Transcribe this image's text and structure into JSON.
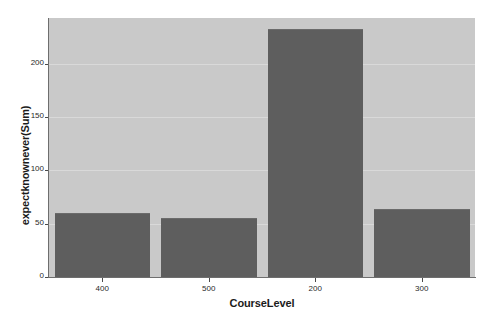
{
  "chart_data": {
    "type": "bar",
    "title": "",
    "subtitle": "",
    "xlabel": "CourseLevel",
    "ylabel": "expectknownever(Sum)",
    "categories": [
      "400",
      "500",
      "200",
      "300"
    ],
    "values": [
      60,
      55,
      233,
      64
    ],
    "series": [
      {
        "name": "expectknownever(Sum)",
        "values": [
          60,
          55,
          233,
          64
        ]
      }
    ],
    "ylim": [
      0,
      243
    ],
    "yticks": [
      "0",
      "50",
      "100",
      "150",
      "200"
    ],
    "ytick_values": [
      0,
      50,
      100,
      150,
      200
    ],
    "xticks": [
      "400",
      "500",
      "200",
      "300"
    ],
    "grid": true,
    "legend": false,
    "legend_position": "none",
    "colors": {
      "bar_fill": "#5e5e5e",
      "plot_background": "#c9c9c9",
      "page_background": "#ffffff",
      "axis_line": "#6e6e6e",
      "text": "#1b1b1b",
      "gridline": "#d8d8d8"
    }
  },
  "axes": {
    "y_title": "expectknownever(Sum)",
    "x_title": "CourseLevel",
    "y_ticks": [
      {
        "label": "200",
        "value": 200
      },
      {
        "label": "150",
        "value": 150
      },
      {
        "label": "100",
        "value": 100
      },
      {
        "label": "50",
        "value": 50
      },
      {
        "label": "0",
        "value": 0
      }
    ],
    "x_ticks": [
      {
        "label": "400"
      },
      {
        "label": "500"
      },
      {
        "label": "200"
      },
      {
        "label": "300"
      }
    ]
  },
  "bars": [
    {
      "category": "400",
      "value": 60
    },
    {
      "category": "500",
      "value": 55
    },
    {
      "category": "200",
      "value": 233
    },
    {
      "category": "300",
      "value": 64
    }
  ]
}
